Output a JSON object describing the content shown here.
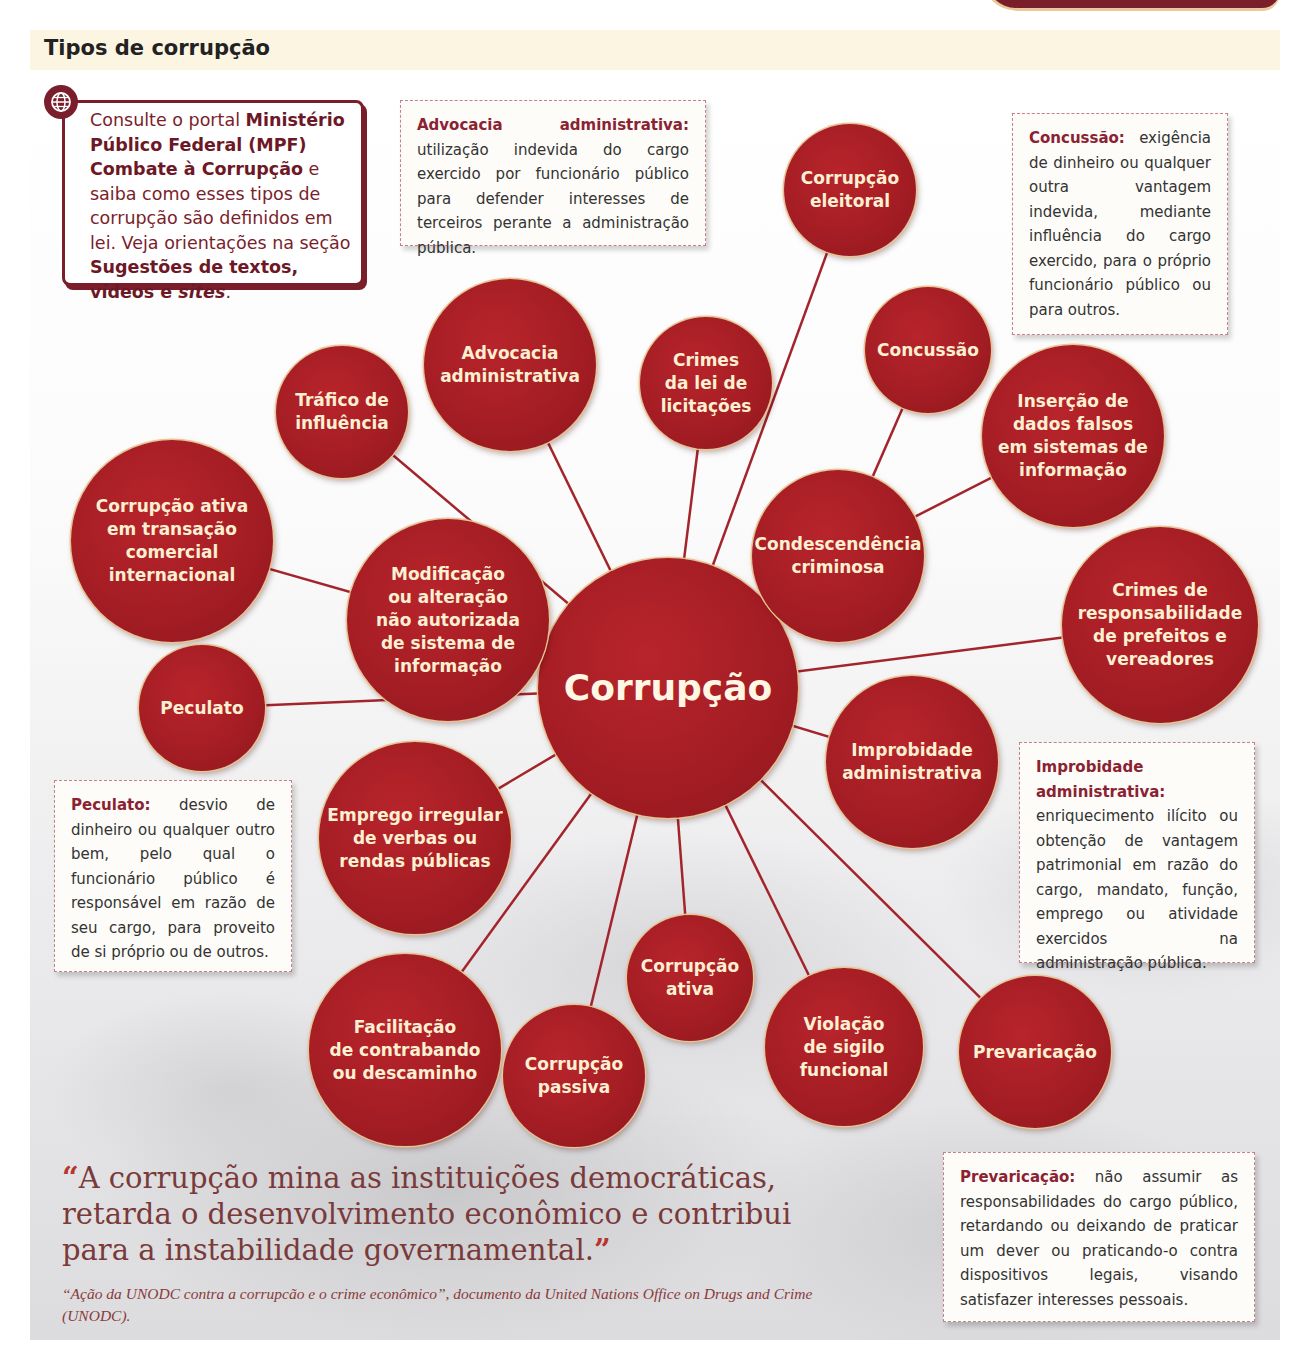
{
  "header": {
    "title": "Tipos de corrupção"
  },
  "web_tip": {
    "icon": "globe-icon",
    "text_parts": [
      {
        "t": "Consulte o portal ",
        "bold": false
      },
      {
        "t": "Ministério Público Federal (MPF) Combate à Corrupção",
        "bold": true
      },
      {
        "t": " e saiba como esses tipos de corrupção são definidos em lei. Veja orientações na seção ",
        "bold": false
      },
      {
        "t": "Sugestões de textos, vídeos e ",
        "bold": true
      },
      {
        "t": "sites",
        "bold": true,
        "italic": true
      },
      {
        "t": ".",
        "bold": false
      }
    ]
  },
  "diagram": {
    "center": {
      "label": "Corrupção",
      "x": 668,
      "y": 688,
      "r": 130
    },
    "nodes": [
      {
        "id": "eleitoral",
        "label": "Corrupção\neleitoral",
        "x": 850,
        "y": 190,
        "r": 66,
        "link": "center"
      },
      {
        "id": "advocacia",
        "label": "Advocacia\nadministrativa",
        "x": 510,
        "y": 365,
        "r": 86,
        "link": "center"
      },
      {
        "id": "licitacoes",
        "label": "Crimes\nda lei de\nlicitações",
        "x": 706,
        "y": 383,
        "r": 66,
        "link": "center"
      },
      {
        "id": "trafico",
        "label": "Tráfico de\ninfluência",
        "x": 342,
        "y": 412,
        "r": 66,
        "link": "center"
      },
      {
        "id": "concussao",
        "label": "Concussão",
        "x": 928,
        "y": 350,
        "r": 63,
        "link": "condescendencia"
      },
      {
        "id": "insercao",
        "label": "Inserção de\ndados falsos\nem sistemas de\ninformação",
        "x": 1073,
        "y": 436,
        "r": 91,
        "link": "condescendencia"
      },
      {
        "id": "condescendencia",
        "label": "Condescendência\ncriminosa",
        "x": 838,
        "y": 556,
        "r": 86,
        "link": "center"
      },
      {
        "id": "transacao",
        "label": "Corrupção ativa\nem transação\ncomercial\ninternacional",
        "x": 172,
        "y": 541,
        "r": 101,
        "link": "modificacao"
      },
      {
        "id": "modificacao",
        "label": "Modificação\nou alteração\nnão autorizada\nde sistema de\ninformação",
        "x": 448,
        "y": 620,
        "r": 101,
        "link": "center"
      },
      {
        "id": "responsabilidade",
        "label": "Crimes de\nresponsabilidade\nde prefeitos e\nvereadores",
        "x": 1160,
        "y": 625,
        "r": 98,
        "link": "center"
      },
      {
        "id": "peculato",
        "label": "Peculato",
        "x": 202,
        "y": 708,
        "r": 63,
        "link": "center"
      },
      {
        "id": "improbidade",
        "label": "Improbidade\nadministrativa",
        "x": 912,
        "y": 762,
        "r": 86,
        "link": "center"
      },
      {
        "id": "emprego",
        "label": "Emprego irregular\nde verbas ou\nrendas públicas",
        "x": 415,
        "y": 838,
        "r": 96,
        "link": "center"
      },
      {
        "id": "ativa",
        "label": "Corrupção\nativa",
        "x": 690,
        "y": 978,
        "r": 63,
        "link": "center"
      },
      {
        "id": "facilitacao",
        "label": "Facilitação\nde contrabando\nou descaminho",
        "x": 405,
        "y": 1050,
        "r": 96,
        "link": "center"
      },
      {
        "id": "passiva",
        "label": "Corrupção\npassiva",
        "x": 574,
        "y": 1076,
        "r": 71,
        "link": "center"
      },
      {
        "id": "violacao",
        "label": "Violação\nde sigilo\nfuncional",
        "x": 844,
        "y": 1047,
        "r": 79,
        "link": "center"
      },
      {
        "id": "prevaricacao",
        "label": "Prevaricação",
        "x": 1035,
        "y": 1052,
        "r": 76,
        "link": "center"
      }
    ]
  },
  "definitions": [
    {
      "id": "advocacia",
      "term": "Advocacia administrativa:",
      "text": " utilização indevida do cargo exercido por funcionário público para defender interesses de terceiros perante a administração pública.",
      "x": 400,
      "y": 100,
      "w": 306,
      "h": 146
    },
    {
      "id": "concussao",
      "term": "Concussão:",
      "text": " exigência de dinheiro ou qualquer outra vantagem indevida, mediante influência do cargo exercido, para o próprio funcionário público ou para outros.",
      "x": 1012,
      "y": 113,
      "w": 216,
      "h": 222
    },
    {
      "id": "peculato",
      "term": "Peculato:",
      "text": " desvio de dinheiro ou qualquer outro bem, pelo qual o funcionário público é responsável em razão de seu cargo, para proveito de si próprio ou de outros.",
      "x": 54,
      "y": 780,
      "w": 238,
      "h": 192
    },
    {
      "id": "improbidade",
      "term": "Improbidade administrativa:",
      "text": " enriquecimento ilícito ou obtenção de vantagem patrimonial em razão do cargo, mandato, função, emprego ou atividade exercidos na administração pública.",
      "x": 1019,
      "y": 742,
      "w": 236,
      "h": 221
    },
    {
      "id": "prevaricacao",
      "term": "Prevaricação:",
      "text": " não assumir as responsabilidades do cargo público, retardando ou deixando de praticar um dever ou praticando-o contra dispositivos legais, visando satisfazer interesses pessoais.",
      "x": 943,
      "y": 1152,
      "w": 312,
      "h": 170
    }
  ],
  "quote": {
    "open_mark": "“",
    "text": "A corrupção mina as instituições democráticas, retarda o desenvolvimento econômico e contribui para a instabilidade governamental.",
    "close_mark": "”",
    "citation": "“Ação da UNODC contra a corrupcão e o crime econômico”, documento da United Nations Office on Drugs and Crime (UNODC)."
  },
  "colors": {
    "node_fill": "#a51d24",
    "node_text": "#fdf0d2",
    "accent_dark": "#7a1e2b",
    "link_line": "#a3242b",
    "definition_term": "#8a2232"
  }
}
